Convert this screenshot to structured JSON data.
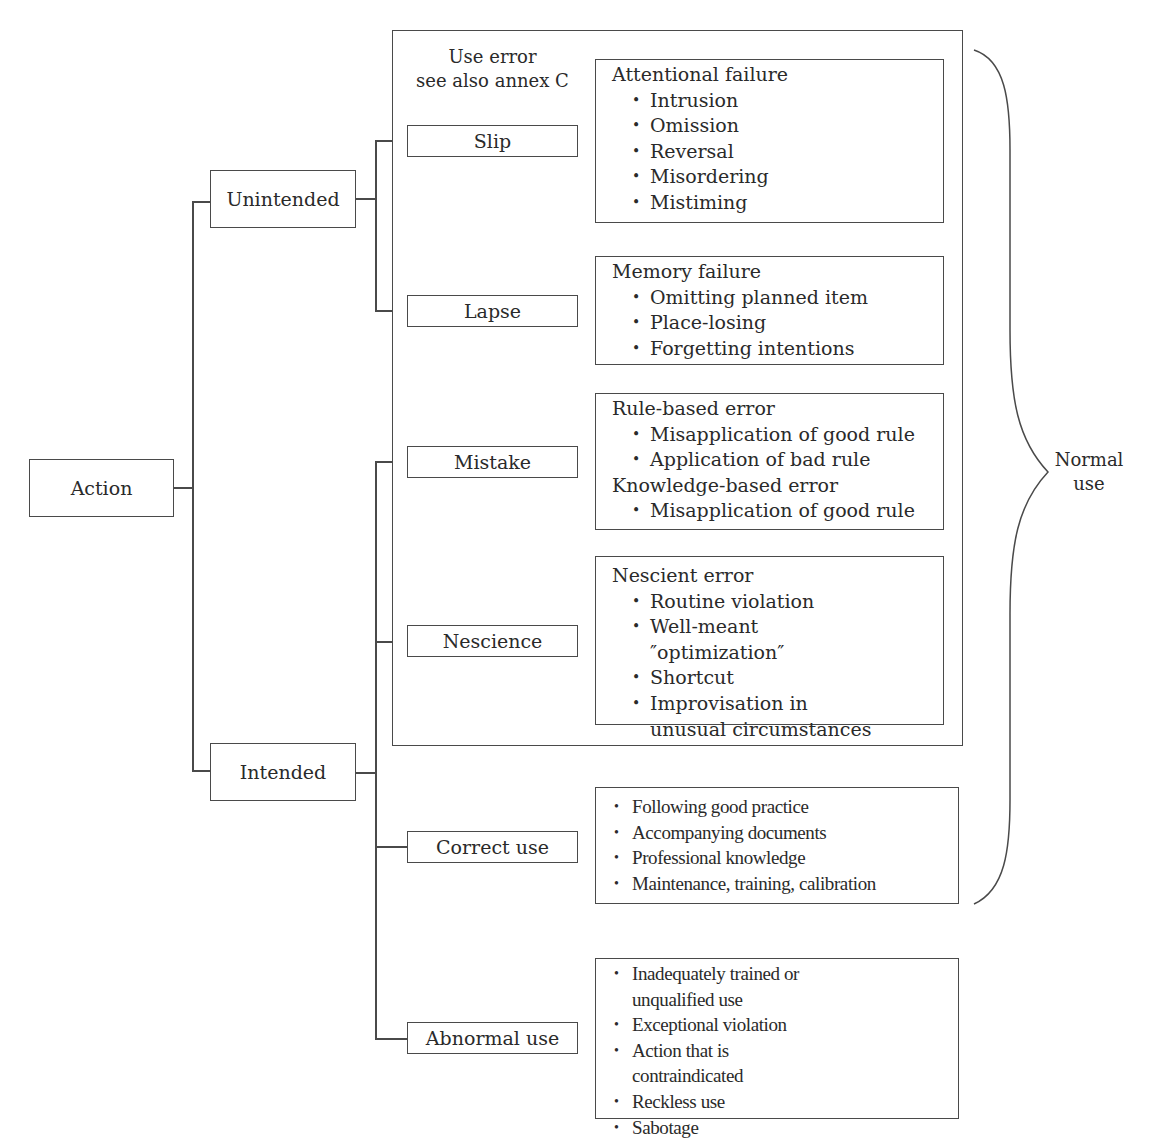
{
  "diagram": {
    "root": "Action",
    "branches": {
      "unintended": "Unintended",
      "intended": "Intended"
    },
    "use_error_group": {
      "title_line1": "Use error",
      "title_line2": "see also annex C"
    },
    "leaves": {
      "slip": "Slip",
      "lapse": "Lapse",
      "mistake": "Mistake",
      "nescience": "Nescience",
      "correct_use": "Correct use",
      "abnormal_use": "Abnormal use"
    },
    "details": {
      "slip": {
        "heading": "Attentional failure",
        "items": [
          "Intrusion",
          "Omission",
          "Reversal",
          "Misordering",
          "Mistiming"
        ]
      },
      "lapse": {
        "heading": "Memory failure",
        "items": [
          "Omitting planned item",
          "Place-losing",
          "Forgetting intentions"
        ]
      },
      "mistake": {
        "heading1": "Rule-based error",
        "items1": [
          "Misapplication of good rule",
          "Application of bad rule"
        ],
        "heading2": "Knowledge-based error",
        "items2": [
          "Misapplication of good rule"
        ]
      },
      "nescience": {
        "heading": "Nescient error",
        "items": [
          "Routine violation",
          "Well-meant ″optimization″",
          "Shortcut",
          "Improvisation in unusual circumstances"
        ]
      },
      "correct_use": {
        "items": [
          "Following good practice",
          "Accompanying documents",
          "Professional knowledge",
          "Maintenance, training, calibration"
        ]
      },
      "abnormal_use": {
        "items": [
          "Inadequately trained or unqualified use",
          "Exceptional violation",
          "Action that is contraindicated",
          "Reckless use",
          "Sabotage"
        ]
      }
    },
    "brace_label": {
      "line1": "Normal",
      "line2": "use"
    }
  }
}
